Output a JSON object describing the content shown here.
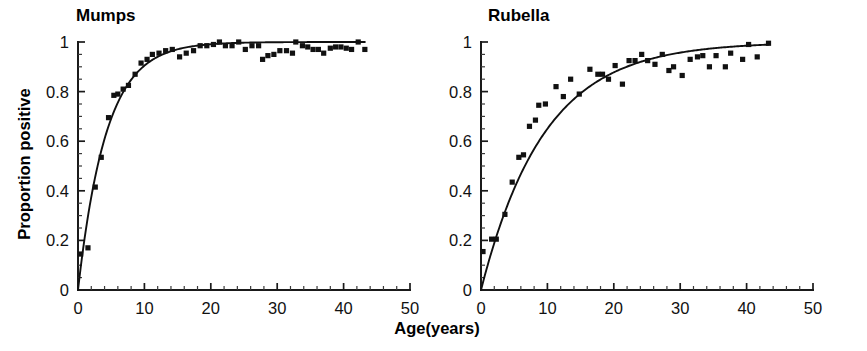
{
  "figure": {
    "xlabel": "Age(years)",
    "ylabel": "Proportion positive"
  },
  "chart_data": [
    {
      "type": "scatter",
      "title": "Mumps",
      "xlabel": "Age(years)",
      "ylabel": "Proportion positive",
      "xlim": [
        0,
        50
      ],
      "ylim": [
        0,
        1
      ],
      "xticks": [
        0,
        10,
        20,
        30,
        40,
        50
      ],
      "xtick_labels": [
        "0",
        "10",
        "20",
        "30",
        "40",
        "50"
      ],
      "yticks": [
        0,
        0.2,
        0.4,
        0.6,
        0.8,
        1
      ],
      "ytick_labels": [
        "0",
        "0.2",
        "0.4",
        "0.6",
        "0.8",
        "1"
      ],
      "x_minor_tick_interval": 2,
      "y_minor_tick_interval": 0.05,
      "grid": false,
      "legend": null,
      "marker": "filled-square",
      "marker_color": "#111111",
      "line_color": "#101010",
      "points": [
        {
          "x": 0.4,
          "y": 0.145
        },
        {
          "x": 1.5,
          "y": 0.17
        },
        {
          "x": 2.6,
          "y": 0.415
        },
        {
          "x": 3.5,
          "y": 0.535
        },
        {
          "x": 4.6,
          "y": 0.695
        },
        {
          "x": 5.4,
          "y": 0.785
        },
        {
          "x": 6.0,
          "y": 0.79
        },
        {
          "x": 6.8,
          "y": 0.81
        },
        {
          "x": 7.6,
          "y": 0.825
        },
        {
          "x": 8.6,
          "y": 0.87
        },
        {
          "x": 9.5,
          "y": 0.915
        },
        {
          "x": 10.4,
          "y": 0.93
        },
        {
          "x": 11.2,
          "y": 0.95
        },
        {
          "x": 12.2,
          "y": 0.955
        },
        {
          "x": 13.2,
          "y": 0.965
        },
        {
          "x": 14.2,
          "y": 0.97
        },
        {
          "x": 15.3,
          "y": 0.94
        },
        {
          "x": 16.3,
          "y": 0.955
        },
        {
          "x": 17.4,
          "y": 0.965
        },
        {
          "x": 18.4,
          "y": 0.985
        },
        {
          "x": 19.4,
          "y": 0.985
        },
        {
          "x": 20.4,
          "y": 0.99
        },
        {
          "x": 21.3,
          "y": 1.0
        },
        {
          "x": 22.2,
          "y": 0.985
        },
        {
          "x": 23.2,
          "y": 0.985
        },
        {
          "x": 24.2,
          "y": 1.0
        },
        {
          "x": 25.2,
          "y": 0.97
        },
        {
          "x": 26.2,
          "y": 0.985
        },
        {
          "x": 27.2,
          "y": 0.985
        },
        {
          "x": 27.8,
          "y": 0.93
        },
        {
          "x": 28.6,
          "y": 0.945
        },
        {
          "x": 29.5,
          "y": 0.95
        },
        {
          "x": 30.4,
          "y": 0.965
        },
        {
          "x": 31.4,
          "y": 0.965
        },
        {
          "x": 32.3,
          "y": 0.955
        },
        {
          "x": 32.8,
          "y": 1.0
        },
        {
          "x": 33.8,
          "y": 0.985
        },
        {
          "x": 34.6,
          "y": 0.98
        },
        {
          "x": 35.4,
          "y": 0.97
        },
        {
          "x": 36.2,
          "y": 0.97
        },
        {
          "x": 37.0,
          "y": 0.955
        },
        {
          "x": 38.0,
          "y": 0.975
        },
        {
          "x": 38.8,
          "y": 0.98
        },
        {
          "x": 39.6,
          "y": 0.98
        },
        {
          "x": 40.4,
          "y": 0.975
        },
        {
          "x": 41.2,
          "y": 0.97
        },
        {
          "x": 42.2,
          "y": 1.0
        },
        {
          "x": 43.2,
          "y": 0.97
        }
      ],
      "fit": {
        "model": "1 - exp(-lambda * age)",
        "lambda": 0.235,
        "description": "catalytic model fitted curve"
      }
    },
    {
      "type": "scatter",
      "title": "Rubella",
      "xlabel": "Age(years)",
      "ylabel": "Proportion positive",
      "xlim": [
        0,
        50
      ],
      "ylim": [
        0,
        1
      ],
      "xticks": [
        0,
        10,
        20,
        30,
        40,
        50
      ],
      "xtick_labels": [
        "0",
        "10",
        "20",
        "30",
        "40",
        "50"
      ],
      "yticks": [
        0,
        0.2,
        0.4,
        0.6,
        0.8,
        1
      ],
      "ytick_labels": [
        "0",
        "0.2",
        "0.4",
        "0.6",
        "0.8",
        "1"
      ],
      "x_minor_tick_interval": 2,
      "y_minor_tick_interval": 0.05,
      "grid": false,
      "legend": null,
      "marker": "filled-square",
      "marker_color": "#111111",
      "line_color": "#101010",
      "points": [
        {
          "x": 0.3,
          "y": 0.155
        },
        {
          "x": 1.6,
          "y": 0.205
        },
        {
          "x": 2.3,
          "y": 0.205
        },
        {
          "x": 3.6,
          "y": 0.305
        },
        {
          "x": 4.7,
          "y": 0.435
        },
        {
          "x": 5.7,
          "y": 0.535
        },
        {
          "x": 6.4,
          "y": 0.545
        },
        {
          "x": 7.3,
          "y": 0.66
        },
        {
          "x": 8.2,
          "y": 0.685
        },
        {
          "x": 8.7,
          "y": 0.745
        },
        {
          "x": 9.7,
          "y": 0.75
        },
        {
          "x": 11.3,
          "y": 0.82
        },
        {
          "x": 12.4,
          "y": 0.78
        },
        {
          "x": 13.5,
          "y": 0.85
        },
        {
          "x": 14.8,
          "y": 0.79
        },
        {
          "x": 16.4,
          "y": 0.89
        },
        {
          "x": 17.6,
          "y": 0.87
        },
        {
          "x": 18.3,
          "y": 0.87
        },
        {
          "x": 19.2,
          "y": 0.85
        },
        {
          "x": 20.2,
          "y": 0.905
        },
        {
          "x": 21.3,
          "y": 0.83
        },
        {
          "x": 22.3,
          "y": 0.925
        },
        {
          "x": 23.2,
          "y": 0.925
        },
        {
          "x": 24.2,
          "y": 0.95
        },
        {
          "x": 25.1,
          "y": 0.925
        },
        {
          "x": 26.2,
          "y": 0.91
        },
        {
          "x": 27.3,
          "y": 0.95
        },
        {
          "x": 28.3,
          "y": 0.885
        },
        {
          "x": 29.0,
          "y": 0.9
        },
        {
          "x": 30.3,
          "y": 0.865
        },
        {
          "x": 31.5,
          "y": 0.93
        },
        {
          "x": 32.6,
          "y": 0.94
        },
        {
          "x": 33.4,
          "y": 0.945
        },
        {
          "x": 34.4,
          "y": 0.9
        },
        {
          "x": 35.4,
          "y": 0.945
        },
        {
          "x": 36.8,
          "y": 0.9
        },
        {
          "x": 37.6,
          "y": 0.955
        },
        {
          "x": 39.4,
          "y": 0.93
        },
        {
          "x": 40.3,
          "y": 0.99
        },
        {
          "x": 41.6,
          "y": 0.94
        },
        {
          "x": 43.3,
          "y": 0.995
        }
      ],
      "fit": {
        "model": "1 - exp(-lambda * age)",
        "lambda": 0.105,
        "description": "catalytic model fitted curve"
      }
    }
  ]
}
